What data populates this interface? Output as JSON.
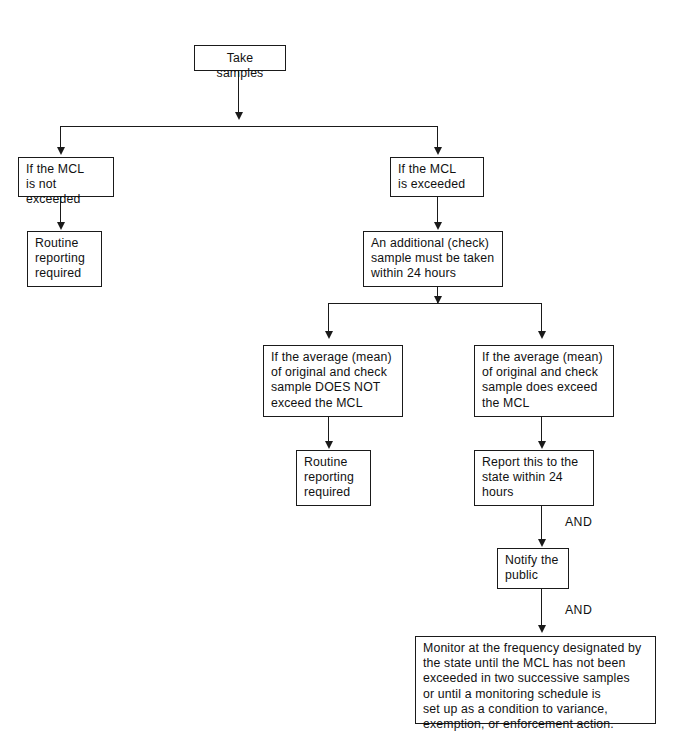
{
  "diagram": {
    "nodes": {
      "take_samples": "Take samples",
      "mcl_not_exceeded": "If the MCL\nis not exceeded",
      "mcl_exceeded": "If the MCL\nis exceeded",
      "routine_left": "Routine\nreporting\nrequired",
      "additional_check": "An additional (check)\nsample must be taken\nwithin 24 hours",
      "avg_not_exceed": "If the average (mean)\nof original and check\nsample DOES NOT\nexceed the MCL",
      "avg_does_exceed": "If the average (mean)\nof original and check\nsample does exceed\nthe MCL",
      "routine_center": "Routine\nreporting\nrequired",
      "report_state": "Report this to the\nstate within 24\nhours",
      "notify_public": "Notify the\npublic",
      "monitor_frequency": "Monitor at the frequency designated by\nthe state until the MCL has not been\nexceeded in two successive samples\nor until a monitoring schedule is\nset up as a condition to variance,\nexemption, or enforcement action."
    },
    "edge_labels": {
      "and_1": "AND",
      "and_2": "AND"
    },
    "colors": {
      "box_border": "#1a1a1a",
      "connector": "#1a1a1a",
      "text": "#111111",
      "background": "#ffffff"
    }
  }
}
